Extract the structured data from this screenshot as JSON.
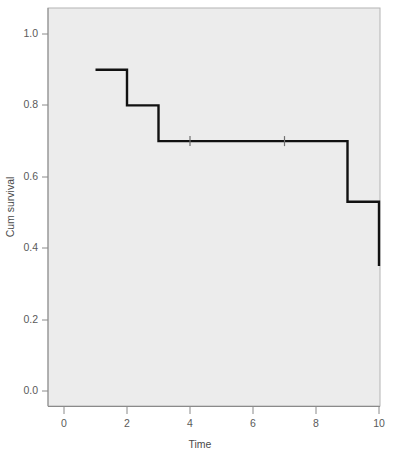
{
  "chart_data": {
    "type": "line",
    "subtype": "kaplan-meier-step",
    "title": "",
    "xlabel": "Time",
    "ylabel": "Cum survival",
    "xlim": [
      -0.5,
      10.6
    ],
    "ylim": [
      -0.03,
      1.06
    ],
    "xticks": [
      0,
      2,
      4,
      6,
      8,
      10
    ],
    "xticklabels": [
      "0",
      "2",
      "4",
      "6",
      "8",
      "10"
    ],
    "yticks": [
      0.0,
      0.2,
      0.4,
      0.6,
      0.8,
      1.0
    ],
    "yticklabels": [
      "0.0",
      "0.2",
      "0.4",
      "0.6",
      "0.8",
      "1.0"
    ],
    "grid": false,
    "legend": false,
    "series": [
      {
        "name": "Cum survival",
        "color": "#111111",
        "steps": [
          {
            "x": 1,
            "y": 0.9
          },
          {
            "x": 2,
            "y": 0.9
          },
          {
            "x": 2,
            "y": 0.8
          },
          {
            "x": 3,
            "y": 0.8
          },
          {
            "x": 3,
            "y": 0.7
          },
          {
            "x": 9,
            "y": 0.7
          },
          {
            "x": 9,
            "y": 0.53
          },
          {
            "x": 10,
            "y": 0.53
          },
          {
            "x": 10,
            "y": 0.35
          }
        ]
      }
    ],
    "censored": [
      {
        "x": 4,
        "y": 0.7
      },
      {
        "x": 7,
        "y": 0.7
      }
    ],
    "plot_background": "#ececec",
    "plot_border_color": "#b4b4b4",
    "axis_color": "#8a8a8a",
    "line_color": "#111111"
  },
  "axes": {
    "y_title": "Cum survival",
    "x_title": "Time",
    "y_tick_0": "1.0",
    "y_tick_1": "0.8",
    "y_tick_2": "0.6",
    "y_tick_3": "0.4",
    "y_tick_4": "0.2",
    "y_tick_5": "0.0",
    "x_tick_0": "0",
    "x_tick_1": "2",
    "x_tick_2": "4",
    "x_tick_3": "6",
    "x_tick_4": "8",
    "x_tick_5": "10"
  }
}
